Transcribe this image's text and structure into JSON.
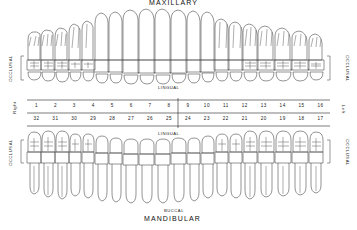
{
  "chart": {
    "title_top": "MAXILLARY",
    "title_bottom": "MANDIBULAR",
    "side_label_left_upper": "OCCLUSAL",
    "side_label_right_upper": "OCCLUSAL",
    "side_label_left_lower": "OCCLUSAL",
    "side_label_right_lower": "OCCLUSAL",
    "lingual_upper": "LINGUAL",
    "lingual_lower": "LINGUAL",
    "buccal_bottom": "BUCCAL",
    "side_right_text": "Right",
    "side_left_text": "Left",
    "ink_color": "#3a3a3a",
    "background_color": "#ffffff"
  },
  "chart_data": {
    "type": "diagram",
    "maxillary_numbers": [
      "1",
      "2",
      "3",
      "4",
      "5",
      "6",
      "7",
      "8",
      "9",
      "10",
      "11",
      "12",
      "13",
      "14",
      "15",
      "16"
    ],
    "mandibular_numbers": [
      "32",
      "31",
      "30",
      "29",
      "28",
      "27",
      "26",
      "25",
      "24",
      "23",
      "22",
      "21",
      "20",
      "19",
      "18",
      "17"
    ],
    "maxillary_tooth_types": [
      "molar",
      "molar",
      "molar",
      "premolar",
      "premolar",
      "canine",
      "incisor",
      "incisor",
      "incisor",
      "incisor",
      "canine",
      "premolar",
      "premolar",
      "molar",
      "molar",
      "molar"
    ],
    "mandibular_tooth_types": [
      "molar",
      "molar",
      "molar",
      "premolar",
      "premolar",
      "canine",
      "incisor",
      "incisor",
      "incisor",
      "incisor",
      "canine",
      "premolar",
      "premolar",
      "molar",
      "molar",
      "molar"
    ],
    "arch_count": 2,
    "teeth_per_arch": 16,
    "total_teeth": 32
  }
}
